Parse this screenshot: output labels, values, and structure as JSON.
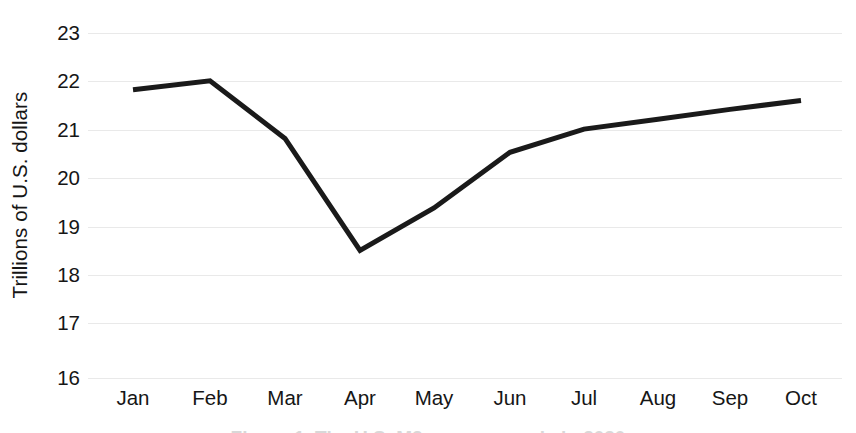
{
  "chart_data": {
    "type": "line",
    "title": "",
    "subtitle": "",
    "xlabel": "",
    "ylabel": "Trillions of U.S. dollars",
    "categories": [
      "Jan",
      "Feb",
      "Mar",
      "Apr",
      "May",
      "Jun",
      "Jul",
      "Aug",
      "Sep",
      "Oct"
    ],
    "values": [
      21.85,
      22.03,
      20.86,
      18.59,
      19.45,
      20.58,
      21.05,
      21.25,
      21.45,
      21.63
    ],
    "series": [
      {
        "name": "M2 money supply",
        "values": [
          21.85,
          22.03,
          20.86,
          18.59,
          19.45,
          20.58,
          21.05,
          21.25,
          21.45,
          21.63
        ]
      }
    ],
    "ylim": [
      16,
      23
    ],
    "ytick_labels": [
      "23",
      "22",
      "21",
      "20",
      "19",
      "18",
      "17",
      "16"
    ],
    "ytick_values": [
      23,
      22,
      21,
      20,
      19,
      18,
      17,
      16
    ],
    "grid": true,
    "grid_axis": "y",
    "grid_color": "#e9e9e9",
    "legend": false,
    "legend_position": "none",
    "line_color": "#1a1a1a",
    "line_width": 5,
    "markers": false,
    "axis_lines": false,
    "annotations": []
  },
  "axes": {
    "y_title": "Trillions of U.S. dollars"
  },
  "caption": {
    "clipped_text": "Figure 1. The U.S. M2 money supply in 2020"
  }
}
